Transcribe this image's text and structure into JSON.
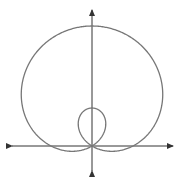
{
  "figure": {
    "equation_form": "r = a + b sin(theta)",
    "params_px": {
      "a": 41,
      "b": 79
    },
    "origin_px": [
      92,
      146
    ],
    "colors": {
      "curve": "#777777",
      "axes": "#333333",
      "background": "#ffffff"
    },
    "x_axis": {
      "from": 12,
      "to": 173
    },
    "y_axis": {
      "from": 10,
      "to": 171
    }
  }
}
